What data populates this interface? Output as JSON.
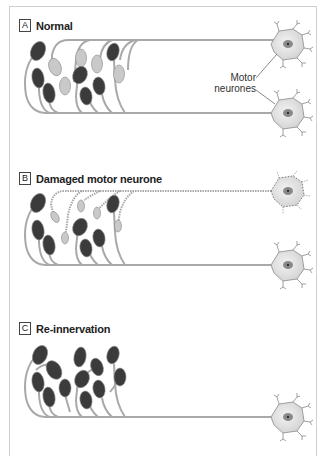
{
  "figure": {
    "panels": [
      {
        "letter": "A",
        "title": "Normal"
      },
      {
        "letter": "B",
        "title": "Damaged motor neurone"
      },
      {
        "letter": "C",
        "title": "Re-innervation"
      }
    ],
    "neuron_label_line1": "Motor",
    "neuron_label_line2": "neurones"
  },
  "colors": {
    "frame": "#cfcfcf",
    "axon": "#a9a9a9",
    "dark_fiber": "#3b3b3b",
    "light_fiber": "#c9c9c9",
    "neuron_body": "#e6e6e6",
    "nucleus": "#7a7a7a"
  }
}
